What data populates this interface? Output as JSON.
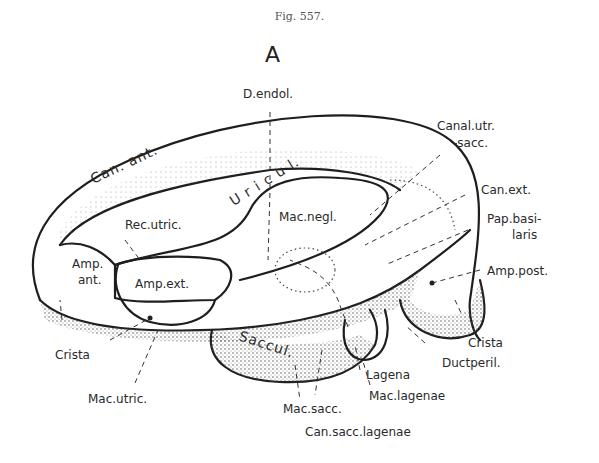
{
  "figure": {
    "caption": "Fig. 557.",
    "panel": "A"
  },
  "labels": {
    "d_endol": "D.endol.",
    "canal_utr_sacc_1": "Canal.utr.",
    "canal_utr_sacc_2": "-sacc.",
    "can_ext": "Can.ext.",
    "pap_basilaris_1": "Pap.basi-",
    "pap_basilaris_2": "laris",
    "amp_post": "Amp.post.",
    "can_ant": "Can. ant.",
    "utricul": "U r i c u l.",
    "rec_utric": "Rec.utric.",
    "mac_negl": "Mac.negl.",
    "amp_ant_1": "Amp.",
    "amp_ant_2": "ant.",
    "amp_ext": "Amp.ext.",
    "crista_left": "Crista",
    "crista_right": "Crista",
    "ductperil": "Ductperil.",
    "saccul": "Saccul.",
    "lagena": "Lagena",
    "mac_lagenae": "Mac.lagenae",
    "mac_sacc": "Mac.sacc.",
    "mac_utric": "Mac.utric.",
    "can_sacc_lagenae": "Can.sacc.lagenae"
  }
}
